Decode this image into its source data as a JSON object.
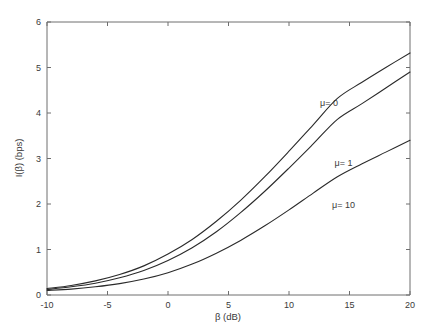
{
  "chart_data": {
    "type": "line",
    "title": "",
    "xlabel": "β (dB)",
    "ylabel": "I(β) (bps)",
    "xlim": [
      -10,
      20
    ],
    "ylim": [
      0,
      6
    ],
    "xticks": [
      -10,
      -5,
      0,
      5,
      10,
      15,
      20
    ],
    "xticklabels": [
      "-10",
      "-5",
      "0",
      "5",
      "10",
      "15",
      "20"
    ],
    "yticks": [
      0,
      1,
      2,
      3,
      4,
      5,
      6
    ],
    "yticklabels": [
      "0",
      "1",
      "2",
      "3",
      "4",
      "5",
      "6"
    ],
    "grid": false,
    "legend_position": "inline-annotations",
    "x": [
      -10,
      -8,
      -6,
      -4,
      -2,
      0,
      2,
      4,
      6,
      8,
      10,
      12,
      14,
      16,
      18,
      20
    ],
    "series": [
      {
        "name": "μ= 0",
        "label": "μ= 0",
        "label_x": 13.3,
        "label_y": 4.15,
        "values": [
          0.14,
          0.21,
          0.31,
          0.45,
          0.64,
          0.9,
          1.22,
          1.62,
          2.08,
          2.6,
          3.16,
          3.74,
          4.32,
          4.67,
          5.0,
          5.32
        ]
      },
      {
        "name": "μ= 1",
        "label": "μ= 1",
        "label_x": 14.5,
        "label_y": 2.83,
        "values": [
          0.12,
          0.18,
          0.26,
          0.38,
          0.54,
          0.76,
          1.04,
          1.39,
          1.81,
          2.28,
          2.79,
          3.32,
          3.86,
          4.2,
          4.55,
          4.9
        ]
      },
      {
        "name": "μ= 10",
        "label": "μ= 10",
        "label_x": 14.5,
        "label_y": 1.92,
        "values": [
          0.1,
          0.13,
          0.18,
          0.25,
          0.35,
          0.49,
          0.68,
          0.92,
          1.2,
          1.52,
          1.87,
          2.24,
          2.6,
          2.88,
          3.14,
          3.4
        ]
      }
    ]
  },
  "axes": {
    "x_title": "β (dB)",
    "y_title": "I(β) (bps)"
  }
}
